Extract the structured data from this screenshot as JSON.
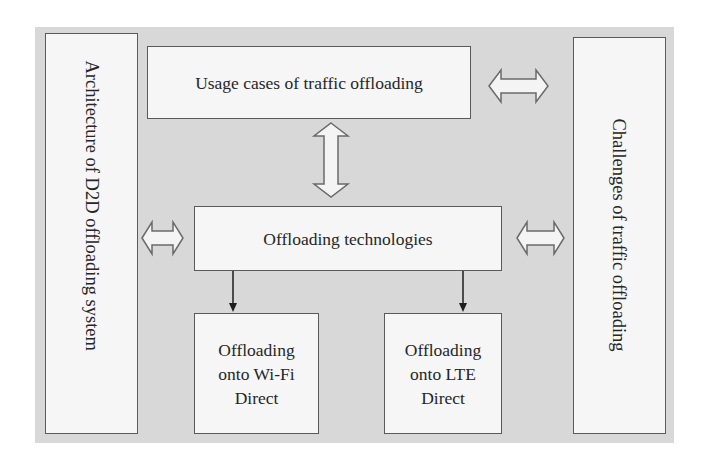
{
  "diagram": {
    "background_color": "#d8d8d8",
    "box_fill": "#f6f6f6",
    "box_border": "#5a5a5a",
    "nodes": {
      "architecture": {
        "label": "Architecture of D2D offloading system",
        "orientation": "vertical"
      },
      "usage_cases": {
        "label": "Usage cases of traffic offloading"
      },
      "technologies": {
        "label": "Offloading technologies"
      },
      "wifi_direct": {
        "label_line1": "Offloading",
        "label_line2": "onto Wi-Fi",
        "label_line3": "Direct"
      },
      "lte_direct": {
        "label_line1": "Offloading",
        "label_line2": "onto LTE",
        "label_line3": "Direct"
      },
      "challenges": {
        "label": "Challenges of traffic offloading",
        "orientation": "vertical"
      }
    },
    "edges": [
      {
        "from": "usage_cases",
        "to": "challenges",
        "type": "double-arrow-hollow"
      },
      {
        "from": "usage_cases",
        "to": "technologies",
        "type": "double-arrow-hollow"
      },
      {
        "from": "architecture",
        "to": "technologies",
        "type": "double-arrow-hollow"
      },
      {
        "from": "technologies",
        "to": "challenges",
        "type": "double-arrow-hollow"
      },
      {
        "from": "technologies",
        "to": "wifi_direct",
        "type": "arrow"
      },
      {
        "from": "technologies",
        "to": "lte_direct",
        "type": "arrow"
      }
    ]
  }
}
